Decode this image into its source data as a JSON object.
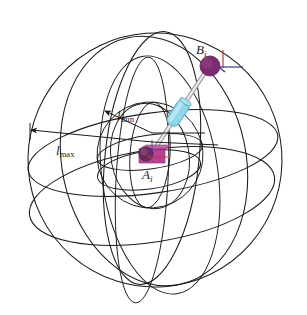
{
  "figure": {
    "background_color": "#ffffff",
    "width": 307,
    "height": 315
  },
  "labels": {
    "point_b": {
      "var": "B",
      "sub": "i",
      "full": "B_i"
    },
    "point_a": {
      "var": "A",
      "sub": "i",
      "full": "A_i"
    },
    "length_min": {
      "var": "l",
      "sub": "min",
      "full": "l_min"
    },
    "length_max": {
      "var": "l",
      "sub": "max",
      "full": "l_max"
    }
  },
  "colors": {
    "wireframe": "#1a1a1a",
    "sphere_b_fill": "#7d2a72",
    "sphere_b_dark": "#5e1f57",
    "node_a_fill": "#b0338f",
    "node_a_dark": "#6b2a5e",
    "cylinder_fill": "#8fd8e8",
    "cylinder_edge": "#4fa8bd",
    "rod": "#9a9aa2",
    "axis_x": "#2b3a8f",
    "axis_z": "#c0392b"
  },
  "geometry": {
    "outer_sphere": {
      "cx": 155,
      "cy": 160,
      "r": 128,
      "name": "l_max boundary sphere"
    },
    "inner_sphere": {
      "cx": 150,
      "cy": 155,
      "r": 53,
      "name": "l_min boundary sphere"
    },
    "point_b": {
      "cx": 210,
      "cy": 66,
      "r": 10
    },
    "point_a": {
      "cx": 150,
      "cy": 155
    },
    "cylinder": {
      "cx": 178,
      "cy": 113,
      "w": 13,
      "h": 26,
      "rotation_deg": -42
    }
  },
  "annotations": [
    {
      "name": "l_min arrow",
      "from": [
        150,
        130
      ],
      "to": [
        104,
        110
      ]
    },
    {
      "name": "l_max arrow",
      "from": [
        150,
        140
      ],
      "to": [
        30,
        131
      ]
    }
  ]
}
